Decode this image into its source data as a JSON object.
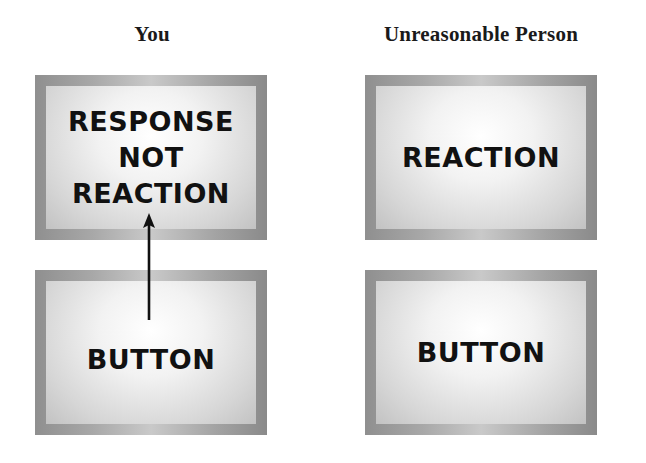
{
  "columns": [
    {
      "title": "You",
      "top_box": {
        "label": "RESPONSE\nNOT\nREACTION"
      },
      "bottom_box": {
        "label": "BUTTON"
      }
    },
    {
      "title": "Unreasonable Person",
      "top_box": {
        "label": "REACTION"
      },
      "bottom_box": {
        "label": "BUTTON"
      }
    }
  ],
  "connectors": [
    {
      "from": "columns.0.bottom_box",
      "to": "columns.0.top_box",
      "type": "arrow-up"
    }
  ],
  "colors": {
    "text": "#111111",
    "frame": "#a0a0a0",
    "fill_light": "#ffffff",
    "fill_dark": "#c2c2c2"
  }
}
